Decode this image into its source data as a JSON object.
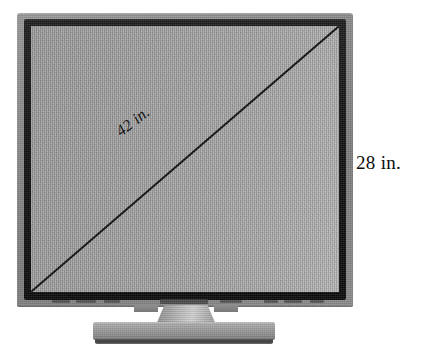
{
  "figure": {
    "type": "geometry-diagram",
    "labels": {
      "diagonal": "42 in.",
      "height": "28 in."
    },
    "measurements": [
      {
        "name": "diagonal",
        "value": 42,
        "unit": "in.",
        "text": "42 in."
      },
      {
        "name": "height",
        "value": 28,
        "unit": "in.",
        "text": "28 in."
      }
    ],
    "colors": {
      "screen": "#a8a8a8",
      "bezel": "#121212",
      "casing": "#8a8a8a",
      "stand": "#a0a0a0",
      "line": "#101010",
      "text": "#0d0d0d",
      "background": "#ffffff"
    }
  },
  "screen": {
    "diagonal_line": {
      "from": "bottom-left",
      "to": "top-right",
      "stroke": "#101010",
      "stroke_width": 2
    }
  },
  "bezel_controls": {
    "marks": [
      {
        "left": 28,
        "width": 18
      },
      {
        "left": 52,
        "width": 20
      },
      {
        "left": 80,
        "width": 16
      },
      {
        "left": 118,
        "width": 12
      },
      {
        "left": 150,
        "width": 30
      },
      {
        "left": 186,
        "width": 22
      },
      {
        "left": 232,
        "width": 14
      },
      {
        "left": 252,
        "width": 18
      },
      {
        "left": 278,
        "width": 14
      }
    ],
    "brand": {
      "left": 136,
      "width": 48
    }
  }
}
